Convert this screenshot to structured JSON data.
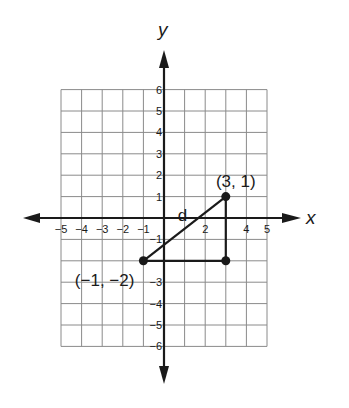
{
  "diagram": {
    "type": "coordinate-plane",
    "x_axis_label": "x",
    "y_axis_label": "y",
    "x_range": [
      -5,
      5
    ],
    "y_range": [
      -6,
      6
    ],
    "x_tick_labels": [
      {
        "value": -5,
        "text": "−5"
      },
      {
        "value": -4,
        "text": "−4"
      },
      {
        "value": -3,
        "text": "−3"
      },
      {
        "value": -2,
        "text": "−2"
      },
      {
        "value": -1,
        "text": "−1"
      },
      {
        "value": 2,
        "text": "2"
      },
      {
        "value": 4,
        "text": "4"
      },
      {
        "value": 5,
        "text": "5"
      }
    ],
    "y_tick_labels": [
      {
        "value": 6,
        "text": "6"
      },
      {
        "value": 5,
        "text": "5"
      },
      {
        "value": 4,
        "text": "4"
      },
      {
        "value": 3,
        "text": "3"
      },
      {
        "value": 2,
        "text": "2"
      },
      {
        "value": 1,
        "text": "1"
      },
      {
        "value": -1,
        "text": "−1"
      },
      {
        "value": -3,
        "text": "−3"
      },
      {
        "value": -4,
        "text": "−4"
      },
      {
        "value": -5,
        "text": "−5"
      },
      {
        "value": -6,
        "text": "−6"
      }
    ],
    "points": [
      {
        "x": -1,
        "y": -2,
        "label": "(−1, −2)"
      },
      {
        "x": 3,
        "y": 1,
        "label": "(3, 1)"
      },
      {
        "x": 3,
        "y": -2,
        "label": ""
      }
    ],
    "segments": [
      {
        "from": [
          -1,
          -2
        ],
        "to": [
          3,
          1
        ],
        "label": "d"
      },
      {
        "from": [
          -1,
          -2
        ],
        "to": [
          3,
          -2
        ],
        "label": ""
      },
      {
        "from": [
          3,
          -2
        ],
        "to": [
          3,
          1
        ],
        "label": ""
      }
    ]
  }
}
